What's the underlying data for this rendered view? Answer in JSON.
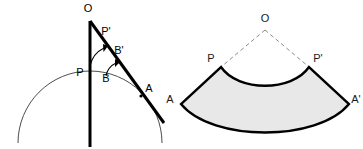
{
  "figure": {
    "background_color": "#ffffff",
    "ink_color": "#000000",
    "thin_curve_color": "#4d4d4d",
    "dashed_ray_color": "#8c8c8c",
    "sector_fill_color": "#e8e8e8",
    "sector_stroke_color": "#000000"
  },
  "left_diagram": {
    "name": "tangent-line-construction",
    "labels": [
      {
        "id": "O",
        "text": "O",
        "x": 88,
        "y": 12
      },
      {
        "id": "Pp",
        "text": "P'",
        "x": 106,
        "y": 35
      },
      {
        "id": "Bp",
        "text": "B'",
        "x": 118,
        "y": 54
      },
      {
        "id": "P",
        "text": "P",
        "x": 79,
        "y": 76
      },
      {
        "id": "B",
        "text": "B",
        "x": 105,
        "y": 81
      },
      {
        "id": "A",
        "text": "A",
        "x": 148,
        "y": 92
      }
    ],
    "points": {
      "O": {
        "x": 90,
        "y": 21
      },
      "P": {
        "x": 90,
        "y": 71
      },
      "B": {
        "x": 112,
        "y": 74
      },
      "A": {
        "x": 140,
        "y": 97
      },
      "Bp": {
        "x": 113,
        "y": 62
      },
      "Pp": {
        "x": 107,
        "y": 45
      }
    },
    "circle": {
      "center_x": 90,
      "center_y": 143,
      "radius": 72
    },
    "vertical_axis": {
      "x": 90,
      "y_top": 21,
      "y_bottom": 147
    },
    "tangent_line": {
      "x1": 90,
      "y1": 21,
      "x2": 164,
      "y2": 123
    },
    "arrow_arcs": [
      {
        "id": "arc-P-to-Pp",
        "from": "P",
        "to": "P'"
      },
      {
        "id": "arc-B-to-Bp",
        "from": "B",
        "to": "B'"
      }
    ]
  },
  "right_diagram": {
    "name": "developed-annular-sector",
    "labels": [
      {
        "id": "O",
        "text": "O",
        "x": 262,
        "y": 21
      },
      {
        "id": "P",
        "text": "P",
        "x": 210,
        "y": 62
      },
      {
        "id": "Pp",
        "text": "P'",
        "x": 308,
        "y": 62
      },
      {
        "id": "A",
        "text": "A",
        "x": 170,
        "y": 103
      },
      {
        "id": "Ap",
        "text": "A'",
        "x": 341,
        "y": 103
      }
    ],
    "points": {
      "O": {
        "x": 265,
        "y": 26
      },
      "P": {
        "x": 220,
        "y": 68
      },
      "Pp": {
        "x": 310,
        "y": 68
      },
      "A": {
        "x": 181,
        "y": 105
      },
      "Ap": {
        "x": 349,
        "y": 105
      }
    },
    "dashed_rays": [
      {
        "id": "ray-O-P",
        "from": "O",
        "to": "P"
      },
      {
        "id": "ray-O-Pp",
        "from": "O",
        "to": "P'"
      }
    ],
    "sector": {
      "inner_arc_from": "P",
      "inner_arc_to": "P'",
      "outer_arc_from": "A",
      "outer_arc_to": "A'",
      "fill": "#e8e8e8",
      "stroke": "#000000"
    }
  }
}
